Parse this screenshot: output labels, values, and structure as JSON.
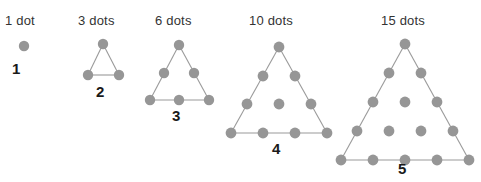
{
  "diagram": {
    "type": "triangular-numbers",
    "dot_color": "#969696",
    "edge_color": "#9a9a9a",
    "label_color": "#333333",
    "index_color": "#1a1a1a",
    "background": "#ffffff",
    "figures": [
      {
        "id": "figure-1",
        "label": "1 dot",
        "index": "1",
        "dot_count": 1,
        "rows": 1,
        "label_x": 5,
        "label_y": 13,
        "index_x": 12,
        "index_y": 60,
        "origin_x": 6,
        "origin_y": 30,
        "width": 60,
        "height": 60,
        "radius": 5.2,
        "dots": [
          {
            "x": 18,
            "y": 16
          }
        ],
        "edges": []
      },
      {
        "id": "figure-2",
        "label": "3 dots",
        "index": "2",
        "dot_count": 3,
        "rows": 2,
        "label_x": 78,
        "label_y": 13,
        "index_x": 96,
        "index_y": 83,
        "origin_x": 76,
        "origin_y": 30,
        "width": 70,
        "height": 70,
        "radius": 5.2,
        "dots": [
          {
            "x": 27,
            "y": 14
          },
          {
            "x": 12,
            "y": 45
          },
          {
            "x": 43,
            "y": 45
          }
        ],
        "edges": [
          {
            "x1": 27,
            "y1": 14,
            "x2": 12,
            "y2": 45
          },
          {
            "x1": 27,
            "y1": 14,
            "x2": 43,
            "y2": 45
          },
          {
            "x1": 12,
            "y1": 45,
            "x2": 43,
            "y2": 45
          }
        ]
      },
      {
        "id": "figure-3",
        "label": "6 dots",
        "index": "3",
        "dot_count": 6,
        "rows": 3,
        "label_x": 155,
        "label_y": 13,
        "index_x": 172,
        "index_y": 107,
        "origin_x": 144,
        "origin_y": 30,
        "width": 80,
        "height": 95,
        "radius": 5.2,
        "dots": [
          {
            "x": 35,
            "y": 15
          },
          {
            "x": 20,
            "y": 43
          },
          {
            "x": 50,
            "y": 43
          },
          {
            "x": 6,
            "y": 70
          },
          {
            "x": 35,
            "y": 70
          },
          {
            "x": 65,
            "y": 70
          }
        ],
        "edges": [
          {
            "x1": 35,
            "y1": 15,
            "x2": 6,
            "y2": 70
          },
          {
            "x1": 35,
            "y1": 15,
            "x2": 65,
            "y2": 70
          },
          {
            "x1": 6,
            "y1": 70,
            "x2": 65,
            "y2": 70
          }
        ]
      },
      {
        "id": "figure-4",
        "label": "10 dots",
        "index": "4",
        "dot_count": 10,
        "rows": 4,
        "label_x": 249,
        "label_y": 13,
        "index_x": 272,
        "index_y": 140,
        "origin_x": 228,
        "origin_y": 30,
        "width": 105,
        "height": 125,
        "radius": 5.4,
        "dots": [
          {
            "x": 51,
            "y": 17
          },
          {
            "x": 35,
            "y": 46
          },
          {
            "x": 67,
            "y": 46
          },
          {
            "x": 19,
            "y": 74
          },
          {
            "x": 51,
            "y": 74
          },
          {
            "x": 83,
            "y": 74
          },
          {
            "x": 3,
            "y": 103
          },
          {
            "x": 35,
            "y": 103
          },
          {
            "x": 67,
            "y": 103
          },
          {
            "x": 99,
            "y": 103
          }
        ],
        "edges": [
          {
            "x1": 51,
            "y1": 17,
            "x2": 3,
            "y2": 103
          },
          {
            "x1": 51,
            "y1": 17,
            "x2": 99,
            "y2": 103
          },
          {
            "x1": 3,
            "y1": 103,
            "x2": 99,
            "y2": 103
          }
        ]
      },
      {
        "id": "figure-5",
        "label": "15 dots",
        "index": "5",
        "dot_count": 15,
        "rows": 5,
        "label_x": 381,
        "label_y": 13,
        "index_x": 398,
        "index_y": 160,
        "origin_x": 340,
        "origin_y": 30,
        "width": 130,
        "height": 145,
        "radius": 5.4,
        "dots": [
          {
            "x": 65,
            "y": 14
          },
          {
            "x": 49,
            "y": 43
          },
          {
            "x": 81,
            "y": 43
          },
          {
            "x": 33,
            "y": 72
          },
          {
            "x": 65,
            "y": 72
          },
          {
            "x": 97,
            "y": 72
          },
          {
            "x": 17,
            "y": 101
          },
          {
            "x": 49,
            "y": 101
          },
          {
            "x": 81,
            "y": 101
          },
          {
            "x": 113,
            "y": 101
          },
          {
            "x": 1,
            "y": 130
          },
          {
            "x": 33,
            "y": 130
          },
          {
            "x": 65,
            "y": 130
          },
          {
            "x": 97,
            "y": 130
          },
          {
            "x": 129,
            "y": 130
          }
        ],
        "edges": [
          {
            "x1": 65,
            "y1": 14,
            "x2": 1,
            "y2": 130
          },
          {
            "x1": 65,
            "y1": 14,
            "x2": 129,
            "y2": 130
          },
          {
            "x1": 1,
            "y1": 130,
            "x2": 129,
            "y2": 130
          }
        ]
      }
    ]
  }
}
